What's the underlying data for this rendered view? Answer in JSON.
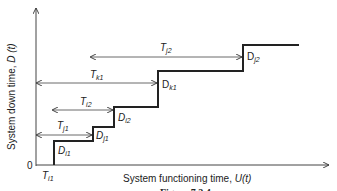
{
  "diagram": {
    "y_axis_label": "System down time, D(t)",
    "y_axis_label_main": "System down time, ",
    "y_axis_label_var": "D (t)",
    "x_axis_label_main": "System functioning time, ",
    "x_axis_label_var": "U(t)",
    "origin_label": "0",
    "caption": "Figure 7.2.4",
    "intervals": [
      {
        "name": "T",
        "sub": "i1"
      },
      {
        "name": "T",
        "sub": "j1"
      },
      {
        "name": "T",
        "sub": "i2"
      },
      {
        "name": "T",
        "sub": "k1"
      },
      {
        "name": "T",
        "sub": "j2"
      }
    ],
    "downtimes": [
      {
        "name": "D",
        "sub": "i1"
      },
      {
        "name": "D",
        "sub": "j1"
      },
      {
        "name": "D",
        "sub": "i2"
      },
      {
        "name": "D",
        "sub": "k1"
      },
      {
        "name": "D",
        "sub": "j2"
      }
    ],
    "line_color": "#222222"
  }
}
